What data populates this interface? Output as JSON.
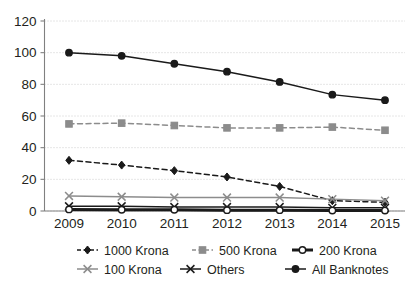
{
  "chart_data": {
    "type": "line",
    "title": "",
    "subtitle": "",
    "xlabel": "",
    "ylabel": "",
    "categories": [
      "2009",
      "2010",
      "2011",
      "2012",
      "2013",
      "2014",
      "2015"
    ],
    "x": [
      2009,
      2010,
      2011,
      2012,
      2013,
      2014,
      2015
    ],
    "ylim": [
      0,
      120
    ],
    "yticks": [
      0,
      20,
      40,
      60,
      80,
      100,
      120
    ],
    "ytick_labels": [
      "0",
      "20",
      "40",
      "60",
      "80",
      "100",
      "120"
    ],
    "grid": true,
    "grid_axis": "y",
    "legend_position": "bottom",
    "legend_columns": 3,
    "series": [
      {
        "name": "1000 Krona",
        "values": [
          32,
          29,
          25.5,
          21.5,
          15.5,
          6.5,
          5.5
        ],
        "color": "#1a1a1a",
        "line_style": "dashed",
        "marker": "diamond",
        "marker_filled": true
      },
      {
        "name": "500 Krona",
        "values": [
          55,
          55.5,
          54,
          52.5,
          52.5,
          53,
          51
        ],
        "color": "#8c8c8c",
        "line_style": "dashed",
        "marker": "square",
        "marker_filled": true
      },
      {
        "name": "200 Krona",
        "values": [
          1,
          0.8,
          0.8,
          0.5,
          0.5,
          0.3,
          0.3
        ],
        "color": "#1a1a1a",
        "line_style": "solid-thick",
        "marker": "circle",
        "marker_filled": false
      },
      {
        "name": "100 Krona",
        "values": [
          9.5,
          9,
          8.5,
          8.5,
          8.5,
          7.5,
          6.5
        ],
        "color": "#8c8c8c",
        "line_style": "solid",
        "marker": "cross",
        "marker_filled": true
      },
      {
        "name": "Others",
        "values": [
          3,
          3,
          2.5,
          2.5,
          2.5,
          2,
          2
        ],
        "color": "#1a1a1a",
        "line_style": "solid",
        "marker": "cross",
        "marker_filled": true
      },
      {
        "name": "All Banknotes",
        "values": [
          100,
          98,
          93,
          88,
          81.5,
          73.5,
          70
        ],
        "color": "#1a1a1a",
        "line_style": "solid",
        "marker": "circle",
        "marker_filled": true
      }
    ]
  },
  "legend": {
    "rows": [
      [
        "1000 Krona",
        "500 Krona",
        "200 Krona"
      ],
      [
        "100 Krona",
        "Others",
        "All Banknotes"
      ]
    ]
  }
}
